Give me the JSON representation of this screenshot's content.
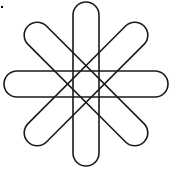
{
  "figure": {
    "center": [
      86,
      84
    ],
    "stadium": {
      "length": 164,
      "thickness": 26
    },
    "rotations_deg": [
      0,
      45,
      90,
      135
    ],
    "stroke_color": "#1a1a1a",
    "stroke_width": 1.6,
    "fill_color": "none",
    "background": "#ffffff"
  },
  "marks": {
    "corner_dot": {
      "x": 1,
      "y": 6
    }
  }
}
